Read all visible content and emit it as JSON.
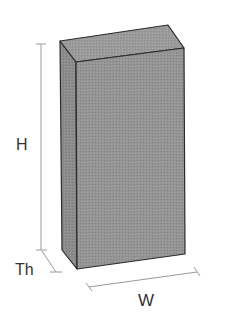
{
  "diagram": {
    "labels": {
      "height": "H",
      "thickness": "Th",
      "width": "W"
    },
    "colors": {
      "face_front": "#939393",
      "face_left": "#8d8d8d",
      "face_top": "#9a9a9a",
      "edge": "#2a2a2a",
      "dimension_line": "#9a9a9a",
      "label_text": "#333333"
    }
  }
}
